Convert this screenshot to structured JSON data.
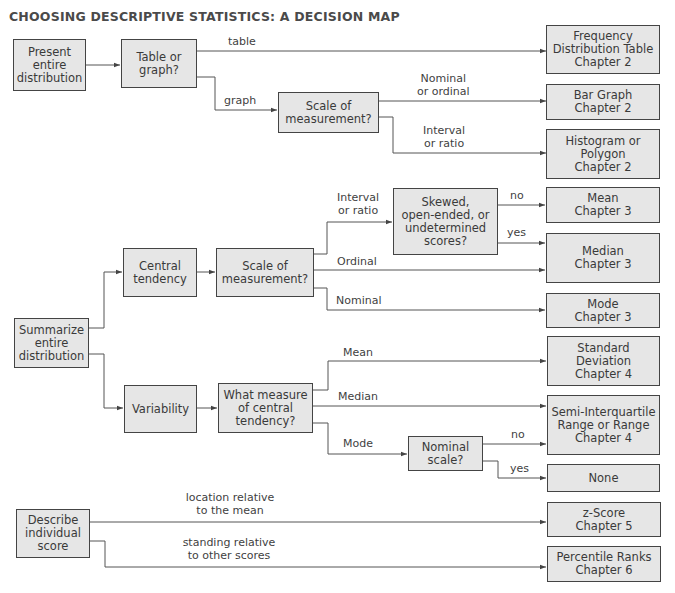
{
  "title": "CHOOSING DESCRIPTIVE STATISTICS: A DECISION MAP",
  "colors": {
    "box_fill": "#e6e6e6",
    "box_border": "#444444",
    "line": "#555555",
    "text": "#3a3a3a"
  },
  "nodes": {
    "present": "Present\nentire\ndistribution",
    "table_or_graph": "Table or\ngraph?",
    "scale1": "Scale of\nmeasurement?",
    "freq_table": "Frequency\nDistribution Table\nChapter 2",
    "bar_graph": "Bar Graph\nChapter 2",
    "histogram": "Histogram or\nPolygon\nChapter 2",
    "summarize": "Summarize\nentire\ndistribution",
    "central_tendency": "Central\ntendency",
    "scale2": "Scale of\nmeasurement?",
    "skewed": "Skewed,\nopen-ended, or\nundetermined\nscores?",
    "mean": "Mean\nChapter 3",
    "median": "Median\nChapter 3",
    "mode": "Mode\nChapter 3",
    "variability": "Variability",
    "what_measure": "What measure\nof central\ntendency?",
    "nominal_scale": "Nominal\nscale?",
    "std_dev": "Standard\nDeviation\nChapter 4",
    "semi_iq": "Semi-Interquartile\nRange or Range\nChapter 4",
    "none": "None",
    "describe": "Describe\nindividual\nscore",
    "z_score": "z-Score\nChapter 5",
    "percentile": "Percentile Ranks\nChapter 6"
  },
  "edge_labels": {
    "table": "table",
    "graph": "graph",
    "nominal_or_ordinal": "Nominal\nor ordinal",
    "interval_or_ratio_1": "Interval\nor ratio",
    "interval_or_ratio_2": "Interval\nor ratio",
    "ordinal": "Ordinal",
    "nominal": "Nominal",
    "no_1": "no",
    "yes_1": "yes",
    "mean": "Mean",
    "median": "Median",
    "mode": "Mode",
    "no_2": "no",
    "yes_2": "yes",
    "location": "location relative\nto the mean",
    "standing": "standing relative\nto other scores"
  }
}
